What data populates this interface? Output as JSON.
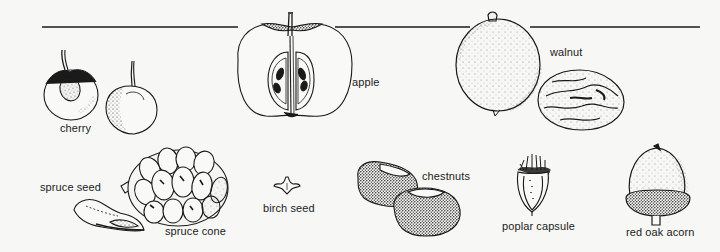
{
  "figure": {
    "background": "#f7f7f5",
    "ink_color": "#1a1a1a",
    "top_rule": {
      "x1": 42,
      "x2": 700,
      "y": 27
    }
  },
  "specimens": [
    {
      "id": "cherry",
      "label": "cherry",
      "icon": "cherry-icon"
    },
    {
      "id": "apple",
      "label": "apple",
      "icon": "apple-cross-section-icon"
    },
    {
      "id": "walnut",
      "label": "walnut",
      "icon": "walnut-icon"
    },
    {
      "id": "spruce-seed",
      "label": "spruce seed",
      "icon": "spruce-seed-icon"
    },
    {
      "id": "spruce-cone",
      "label": "spruce cone",
      "icon": "spruce-cone-icon"
    },
    {
      "id": "birch-seed",
      "label": "birch seed",
      "icon": "birch-seed-icon"
    },
    {
      "id": "chestnuts",
      "label": "chestnuts",
      "icon": "chestnuts-icon"
    },
    {
      "id": "poplar-capsule",
      "label": "poplar capsule",
      "icon": "poplar-capsule-icon"
    },
    {
      "id": "red-oak-acorn",
      "label": "red oak acorn",
      "icon": "acorn-icon"
    }
  ]
}
